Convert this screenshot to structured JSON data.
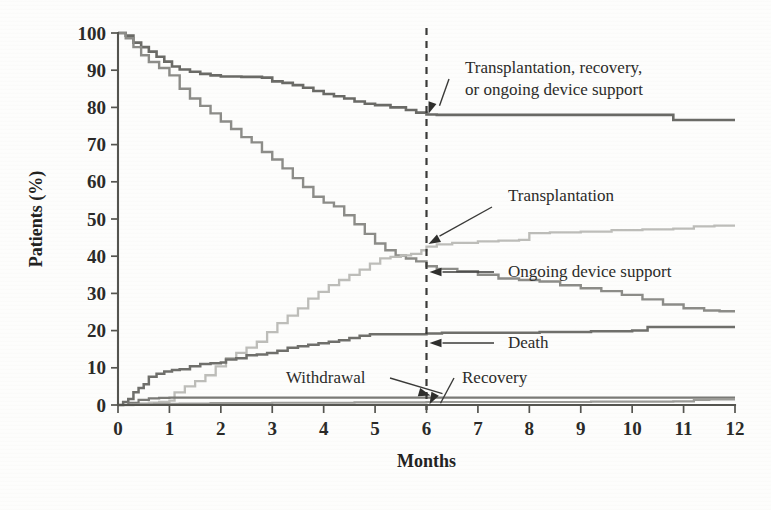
{
  "figure": {
    "background_color": "#fdfdfc",
    "axis_color": "#54544f",
    "text_color": "#2a2a28"
  },
  "chart_data": {
    "type": "line",
    "title": "",
    "subtitle": "",
    "xlabel": "Months",
    "ylabel": "Patients (%)",
    "xlim": [
      0,
      12
    ],
    "ylim": [
      0,
      100
    ],
    "xticks": [
      0,
      1,
      2,
      3,
      4,
      5,
      6,
      7,
      8,
      9,
      10,
      11,
      12
    ],
    "yticks": [
      0,
      10,
      20,
      30,
      40,
      50,
      60,
      70,
      80,
      90,
      100
    ],
    "xtick_labels": [
      "0",
      "1",
      "2",
      "3",
      "4",
      "5",
      "6",
      "7",
      "8",
      "9",
      "10",
      "11",
      "12"
    ],
    "ytick_labels": [
      "0",
      "10",
      "20",
      "30",
      "40",
      "50",
      "60",
      "70",
      "80",
      "90",
      "100"
    ],
    "grid": false,
    "legend_position": "inline-annotations",
    "step_style": "post",
    "annotations": [
      {
        "id": "composite",
        "text": "Transplantation, recovery, or ongoing device support",
        "lines": [
          "Transplantation, recovery,",
          "or ongoing device support"
        ],
        "value_at_6_months": 78,
        "target_x": 6,
        "target_y": 78
      },
      {
        "id": "transplantation",
        "text": "Transplantation",
        "lines": [
          "Transplantation"
        ],
        "value_at_6_months": 43,
        "target_x": 6,
        "target_y": 43
      },
      {
        "id": "ongoing-device-support",
        "text": "Ongoing device support",
        "lines": [
          "Ongoing device support"
        ],
        "value_at_6_months": 37,
        "target_x": 6,
        "target_y": 37
      },
      {
        "id": "death",
        "text": "Death",
        "lines": [
          "Death"
        ],
        "value_at_6_months": 19,
        "target_x": 6,
        "target_y": 19
      },
      {
        "id": "withdrawal",
        "text": "Withdrawal",
        "lines": [
          "Withdrawal"
        ],
        "value_at_6_months": 2,
        "target_x": 6,
        "target_y": 2
      },
      {
        "id": "recovery",
        "text": "Recovery",
        "lines": [
          "Recovery"
        ],
        "value_at_6_months": 1,
        "target_x": 6,
        "target_y": 1
      }
    ],
    "reference_line": {
      "orientation": "vertical",
      "x": 6,
      "style": "dashed",
      "label": ""
    },
    "series": [
      {
        "name": "Transplantation, recovery, or ongoing device support",
        "color": "#6a6a66",
        "width": 2.6,
        "x": [
          0,
          0.15,
          0.3,
          0.45,
          0.6,
          0.75,
          0.9,
          1.05,
          1.2,
          1.4,
          1.6,
          1.8,
          2.0,
          2.2,
          2.4,
          2.6,
          2.8,
          3.0,
          3.2,
          3.4,
          3.6,
          3.8,
          4.0,
          4.2,
          4.4,
          4.6,
          4.8,
          5.0,
          5.3,
          5.6,
          5.8,
          6.0,
          6.2,
          6.5,
          7.0,
          7.5,
          8.0,
          8.5,
          9.0,
          9.5,
          10.0,
          10.5,
          10.8,
          11.2,
          11.6,
          12.0
        ],
        "y": [
          100,
          99.3,
          97.4,
          96.2,
          95.0,
          93.6,
          92.3,
          91.0,
          90.2,
          89.6,
          89.0,
          88.6,
          88.3,
          88.3,
          88.2,
          88.2,
          88.0,
          87.0,
          86.6,
          86.0,
          85.3,
          84.4,
          83.6,
          83.0,
          82.4,
          81.6,
          81.0,
          80.6,
          80.0,
          79.3,
          78.6,
          78.1,
          78.0,
          78.0,
          78.0,
          78.0,
          78.0,
          78.0,
          78.0,
          78.0,
          78.0,
          78.0,
          76.6,
          76.6,
          76.6,
          76.6
        ]
      },
      {
        "name": "Ongoing device support",
        "color": "#8c8c88",
        "width": 2.4,
        "x": [
          0,
          0.15,
          0.3,
          0.45,
          0.6,
          0.8,
          1.0,
          1.2,
          1.4,
          1.6,
          1.8,
          2.0,
          2.2,
          2.4,
          2.6,
          2.8,
          3.0,
          3.2,
          3.4,
          3.6,
          3.8,
          4.0,
          4.2,
          4.4,
          4.6,
          4.8,
          5.0,
          5.2,
          5.4,
          5.6,
          5.8,
          6.0,
          6.2,
          6.6,
          7.0,
          7.4,
          7.8,
          8.2,
          8.6,
          9.0,
          9.4,
          9.8,
          10.2,
          10.6,
          11.0,
          11.4,
          11.7,
          12.0
        ],
        "y": [
          100,
          98.6,
          96.2,
          94.0,
          92.2,
          90.6,
          88.6,
          85.0,
          82.4,
          80.4,
          78.4,
          76.2,
          74.2,
          72.0,
          70.6,
          68.0,
          66.0,
          63.6,
          61.0,
          58.6,
          56.0,
          54.4,
          53.4,
          51.0,
          48.6,
          46.0,
          43.4,
          41.6,
          40.2,
          39.4,
          38.6,
          37.3,
          36.6,
          36.0,
          35.0,
          34.0,
          33.6,
          33.2,
          32.2,
          31.4,
          30.6,
          29.6,
          28.4,
          27.0,
          26.0,
          25.4,
          25.2,
          25.2
        ]
      },
      {
        "name": "Transplantation",
        "color": "#bdbdb9",
        "width": 2.3,
        "x": [
          0,
          0.3,
          0.6,
          0.8,
          1.0,
          1.1,
          1.3,
          1.5,
          1.7,
          1.9,
          2.1,
          2.3,
          2.5,
          2.7,
          2.9,
          3.1,
          3.3,
          3.5,
          3.7,
          3.9,
          4.1,
          4.3,
          4.5,
          4.7,
          4.9,
          5.1,
          5.3,
          5.5,
          5.7,
          5.9,
          6.0,
          6.2,
          6.5,
          7.0,
          7.4,
          7.8,
          8.0,
          8.4,
          9.0,
          9.6,
          10.2,
          10.8,
          11.2,
          11.6,
          12.0
        ],
        "y": [
          0,
          0.4,
          0.6,
          0.8,
          1.2,
          3.4,
          5.0,
          6.4,
          8.0,
          10.4,
          12.6,
          14.0,
          15.4,
          17.0,
          19.6,
          22.0,
          24.0,
          26.0,
          28.6,
          30.4,
          32.2,
          33.6,
          35.0,
          36.4,
          38.0,
          39.4,
          39.8,
          40.2,
          40.6,
          41.6,
          42.6,
          43.2,
          43.6,
          44.0,
          44.2,
          44.4,
          46.2,
          46.4,
          46.6,
          47.0,
          47.2,
          47.4,
          48.0,
          48.2,
          48.2
        ]
      },
      {
        "name": "Death",
        "color": "#6f6f6b",
        "width": 2.5,
        "x": [
          0,
          0.1,
          0.2,
          0.3,
          0.4,
          0.5,
          0.6,
          0.75,
          0.9,
          1.05,
          1.2,
          1.4,
          1.6,
          1.8,
          2.0,
          2.1,
          2.3,
          2.5,
          2.7,
          2.9,
          3.1,
          3.3,
          3.5,
          3.7,
          3.9,
          4.1,
          4.3,
          4.5,
          4.7,
          4.9,
          5.1,
          5.3,
          5.5,
          5.8,
          6.0,
          6.3,
          7.0,
          7.6,
          8.2,
          8.8,
          9.2,
          9.6,
          10.0,
          10.3,
          10.6,
          11.0,
          11.5,
          12.0
        ],
        "y": [
          0,
          0.8,
          1.6,
          3.4,
          4.6,
          5.6,
          7.6,
          8.4,
          9.0,
          9.4,
          9.6,
          10.4,
          11.0,
          11.2,
          11.4,
          12.2,
          12.6,
          13.4,
          13.6,
          14.0,
          14.6,
          15.4,
          15.8,
          16.2,
          16.6,
          17.0,
          17.4,
          18.0,
          18.6,
          19.0,
          19.0,
          19.0,
          19.0,
          19.0,
          19.2,
          19.4,
          19.4,
          19.4,
          19.6,
          19.6,
          19.8,
          19.8,
          20.0,
          21.0,
          21.0,
          21.0,
          21.0,
          21.0
        ]
      },
      {
        "name": "Withdrawal",
        "color": "#7a7a76",
        "width": 2.2,
        "x": [
          0,
          0.2,
          0.4,
          0.6,
          0.8,
          1.0,
          1.2,
          1.6,
          2.0,
          2.6,
          3.2,
          4.0,
          4.8,
          5.4,
          6.0,
          6.6,
          7.2,
          8.0,
          8.8,
          9.6,
          10.4,
          11.0,
          11.5,
          11.8,
          12.0
        ],
        "y": [
          0,
          0.6,
          1.4,
          1.8,
          1.9,
          2.0,
          2.0,
          2.0,
          2.0,
          2.0,
          2.0,
          2.0,
          2.0,
          2.0,
          2.0,
          2.0,
          2.0,
          2.0,
          2.0,
          2.0,
          2.0,
          2.0,
          2.0,
          2.0,
          2.0
        ]
      },
      {
        "name": "Recovery",
        "color": "#9b9b97",
        "width": 2.2,
        "x": [
          0,
          0.3,
          0.7,
          1.2,
          1.8,
          2.4,
          3.0,
          3.8,
          4.6,
          5.2,
          6.0,
          6.8,
          7.6,
          8.4,
          9.2,
          10.0,
          10.8,
          11.2,
          11.5,
          11.8,
          12.0
        ],
        "y": [
          0,
          0.2,
          0.3,
          0.4,
          0.5,
          0.5,
          0.6,
          0.6,
          0.7,
          0.7,
          0.8,
          0.8,
          0.8,
          0.8,
          0.9,
          0.9,
          1.0,
          1.4,
          1.5,
          1.5,
          1.5
        ]
      }
    ]
  }
}
